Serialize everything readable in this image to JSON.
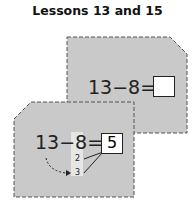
{
  "title": "Lessons 13 and 15",
  "colors": {
    "card_fill": "#c9c9c9",
    "border": "#555555",
    "answer_box": "#ffffff",
    "highlight": "#e6e6e6"
  },
  "card_top": {
    "equation": {
      "minuend": "13",
      "operator": "−",
      "subtrahend": "8",
      "equals": "=",
      "answer": ""
    }
  },
  "card_bottom": {
    "equation": {
      "minuend": "13",
      "operator": "−",
      "subtrahend": "8",
      "equals": "=",
      "answer": "5"
    },
    "decomposition": [
      "2",
      "3"
    ]
  }
}
